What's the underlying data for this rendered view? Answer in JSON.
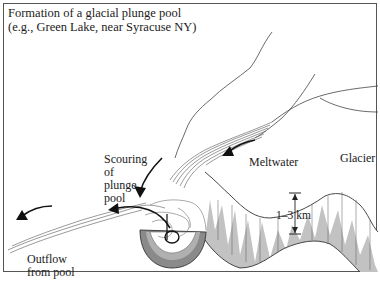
{
  "diagram": {
    "title_line1": "Formation of a glacial plunge pool",
    "title_line2": "(e.g., Green Lake, near Syracuse NY)",
    "labels": {
      "scouring": [
        "Scouring",
        "of",
        "plunge",
        "pool"
      ],
      "meltwater": "Meltwater",
      "glacier": "Glacier",
      "thickness": "1–3 km",
      "outflow": [
        "Outflow",
        "from pool"
      ]
    },
    "colors": {
      "line": "#333333",
      "ice_shade": "#b8b8b8",
      "pool_shade": "#8a8a8a",
      "background": "#ffffff"
    }
  }
}
